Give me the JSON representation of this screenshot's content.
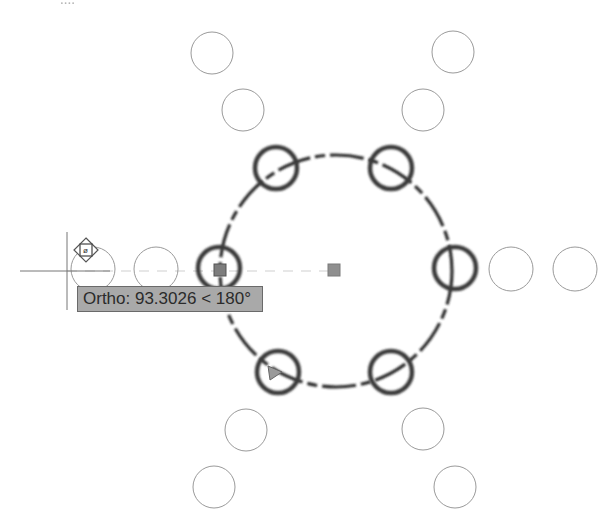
{
  "header": {
    "clipped_text": "...."
  },
  "drawing": {
    "background": "#ffffff",
    "array_center": {
      "x": 335,
      "y": 271
    },
    "path_circle": {
      "cx": 336,
      "cy": 271,
      "r": 116,
      "color": "#2a2a2a",
      "style": "dashed"
    },
    "selected_circles": [
      {
        "cx": 276,
        "cy": 168,
        "r": 21
      },
      {
        "cx": 391,
        "cy": 168,
        "r": 21
      },
      {
        "cx": 219,
        "cy": 268,
        "r": 21
      },
      {
        "cx": 455,
        "cy": 268,
        "r": 21
      },
      {
        "cx": 278,
        "cy": 372,
        "r": 21
      },
      {
        "cx": 391,
        "cy": 372,
        "r": 21
      }
    ],
    "preview_circles": [
      {
        "cx": 212,
        "cy": 53,
        "r": 21
      },
      {
        "cx": 453,
        "cy": 52,
        "r": 21
      },
      {
        "cx": 243,
        "cy": 110,
        "r": 21
      },
      {
        "cx": 423,
        "cy": 110,
        "r": 21
      },
      {
        "cx": 93,
        "cy": 269,
        "r": 22
      },
      {
        "cx": 156,
        "cy": 269,
        "r": 22
      },
      {
        "cx": 511,
        "cy": 269,
        "r": 22
      },
      {
        "cx": 575,
        "cy": 269,
        "r": 22
      },
      {
        "cx": 246,
        "cy": 430,
        "r": 21
      },
      {
        "cx": 423,
        "cy": 429,
        "r": 21
      },
      {
        "cx": 214,
        "cy": 487,
        "r": 21
      },
      {
        "cx": 455,
        "cy": 487,
        "r": 21
      }
    ],
    "grips": [
      {
        "name": "center-grip",
        "x": 334,
        "y": 270
      },
      {
        "name": "base-grip",
        "x": 220,
        "y": 270
      }
    ],
    "crosshair": {
      "x": 67,
      "y": 271
    },
    "move_grip_icon": "move-grip-icon",
    "selection_color": "#3a3a3a",
    "preview_color": "#9a9a9a",
    "grip_color": "#8f8f8f"
  },
  "tooltip": {
    "label": "Ortho: 93.3026 < 180°",
    "background": "#a9a9a9"
  }
}
